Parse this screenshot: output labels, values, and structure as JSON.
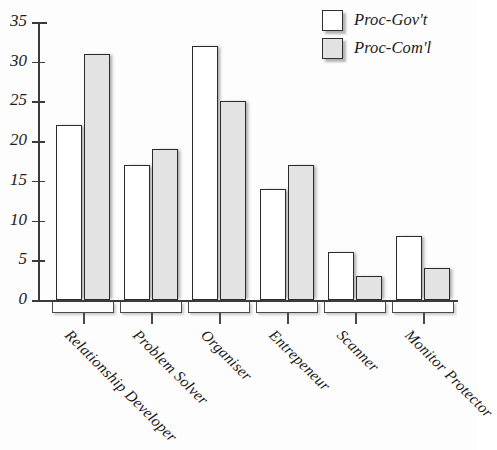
{
  "chart_data": {
    "type": "bar",
    "title": "",
    "subtitle": "",
    "xlabel": "",
    "ylabel": "",
    "categories": [
      "Relationship Developer",
      "Problem Solver",
      "Organiser",
      "Entrepeneur",
      "Scanner",
      "Monitor Protector"
    ],
    "series": [
      {
        "name": "Proc-Gov't",
        "color": "#ffffff",
        "values": [
          22,
          17,
          32,
          14,
          6,
          8
        ]
      },
      {
        "name": "Proc-Com'l",
        "color": "#e3e3e3",
        "values": [
          31,
          19,
          25,
          17,
          3,
          4
        ]
      }
    ],
    "ylim": [
      0,
      35
    ],
    "yticks": [
      0,
      5,
      10,
      15,
      20,
      25,
      30,
      35
    ],
    "ytick_labels": [
      "0",
      "5",
      "10",
      "15",
      "20",
      "25",
      "30",
      "35"
    ],
    "grid": false,
    "legend_position": "top-right",
    "xtick_rotation": 45
  },
  "legend": {
    "entries": [
      {
        "label": "Proc-Gov't",
        "swatch": "white-square"
      },
      {
        "label": "Proc-Com'l",
        "swatch": "gray-square"
      }
    ]
  },
  "colors": {
    "bar_govt": "#ffffff",
    "bar_coml": "#e3e3e3",
    "outline": "#2b2b2b",
    "axis": "#3a3a3a",
    "text": "#1c1c1c",
    "background": "#ffffff"
  }
}
